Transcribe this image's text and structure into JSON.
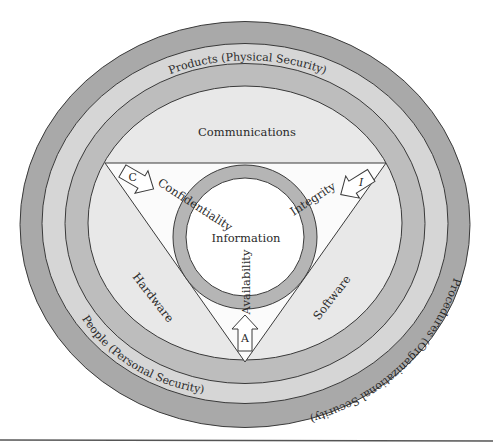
{
  "diagram": {
    "rings": {
      "outer": {
        "label": "Procedures (Organizational Security)",
        "color": "#a9a9a9"
      },
      "second": {
        "label": "People (Personal Security)",
        "color": "#d6d6d6"
      },
      "third": {
        "label": "Products (Physical Security)",
        "color": "#bdbdbd"
      },
      "inner": {
        "color": "#e8e8e8"
      }
    },
    "regions": {
      "top": "Communications",
      "left": "Hardware",
      "right": "Software"
    },
    "triangle": {
      "fill": "#fbfbfb"
    },
    "core": {
      "label": "Information",
      "ring_color": "#b5b5b5",
      "fill": "#ffffff"
    },
    "principles": {
      "confidentiality": {
        "letter": "C",
        "label": "Confidentiality"
      },
      "integrity": {
        "letter": "I",
        "label": "Integrity"
      },
      "availability": {
        "letter": "A",
        "label": "Availability"
      }
    }
  }
}
